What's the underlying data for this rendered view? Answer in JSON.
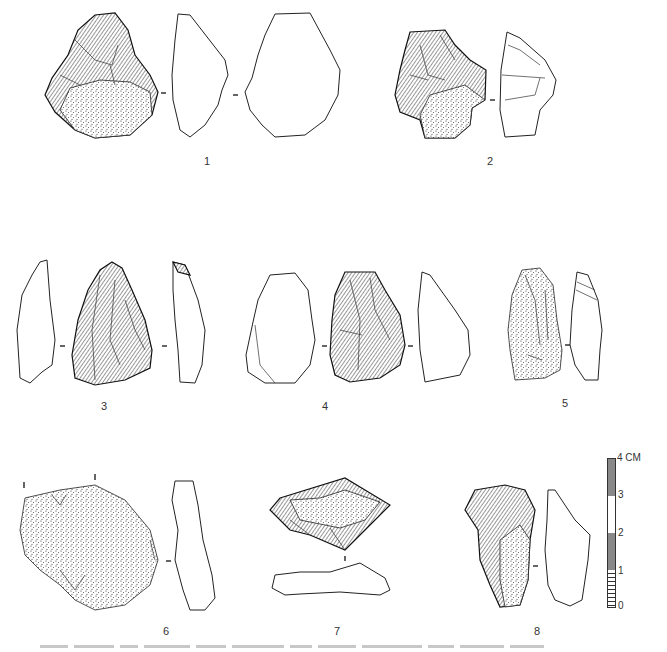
{
  "plate": {
    "figures": [
      {
        "id": "1",
        "label": "1",
        "views": 3
      },
      {
        "id": "2",
        "label": "2",
        "views": 2
      },
      {
        "id": "3",
        "label": "3",
        "views": 3
      },
      {
        "id": "4",
        "label": "4",
        "views": 3
      },
      {
        "id": "5",
        "label": "5",
        "views": 2
      },
      {
        "id": "6",
        "label": "6",
        "views": 2
      },
      {
        "id": "7",
        "label": "7",
        "views": 2
      },
      {
        "id": "8",
        "label": "8",
        "views": 2
      }
    ],
    "scale_bar": {
      "unit": "CM",
      "top_label": "4 CM",
      "ticks": [
        "0",
        "1",
        "2",
        "3"
      ]
    },
    "caption": {
      "visible": "cropped",
      "text": ""
    }
  },
  "colors": {
    "ink": "#111111",
    "paper": "#ffffff"
  }
}
